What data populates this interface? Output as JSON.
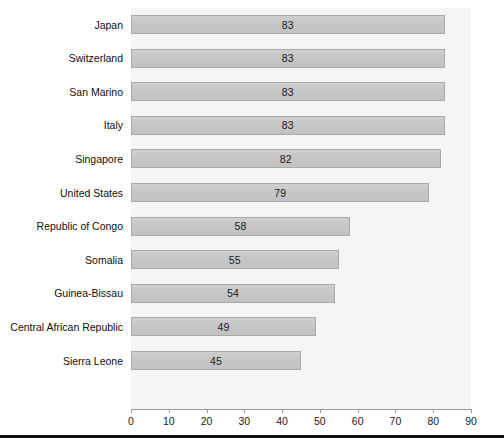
{
  "chart_data": {
    "type": "bar",
    "orientation": "horizontal",
    "title": "",
    "subtitle": "",
    "xlabel": "",
    "ylabel": "",
    "categories": [
      "Japan",
      "Switzerland",
      "San Marino",
      "Italy",
      "Singapore",
      "United States",
      "Republic of Congo",
      "Somalia",
      "Guinea-Bissau",
      "Central African Republic",
      "Sierra Leone"
    ],
    "values": [
      83,
      83,
      83,
      83,
      82,
      79,
      58,
      55,
      54,
      49,
      45
    ],
    "data_labels": [
      "83",
      "83",
      "83",
      "83",
      "82",
      "79",
      "58",
      "55",
      "54",
      "49",
      "45"
    ],
    "xlim": [
      0,
      90
    ],
    "xticks": [
      0,
      10,
      20,
      30,
      40,
      50,
      60,
      70,
      80,
      90
    ],
    "xtick_labels": [
      "0",
      "10",
      "20",
      "30",
      "40",
      "50",
      "60",
      "70",
      "80",
      "90"
    ],
    "grid": false,
    "legend": null,
    "legend_position": "none",
    "annotations": [],
    "colors": {
      "bar_fill": "#c6c6c6",
      "bar_border": "#a9a9a9",
      "plot_background": "#f6f5f3",
      "axis_line": "#9a9a9a",
      "text": "#1c1c1c",
      "rule": "#111111"
    }
  }
}
